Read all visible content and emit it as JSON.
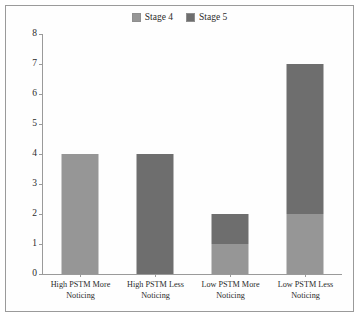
{
  "chart_data": {
    "type": "bar",
    "subtype": "stacked-column",
    "title": "",
    "xlabel": "",
    "ylabel": "",
    "ylim": [
      0,
      8
    ],
    "ytick_step": 1,
    "yticks": [
      "8",
      "7",
      "6",
      "5",
      "4",
      "3",
      "2",
      "1",
      "0"
    ],
    "grid": false,
    "legend_position": "top-center",
    "categories": [
      "High PSTM More Noticing",
      "High PSTM Less Noticing",
      "Low PSTM More Noticing",
      "Low PSTM Less Noticing"
    ],
    "series": [
      {
        "name": "Stage 4",
        "color": "#969696",
        "values": [
          4,
          0,
          1,
          2
        ]
      },
      {
        "name": "Stage 5",
        "color": "#6e6e6e",
        "values": [
          0,
          4,
          1,
          5
        ]
      }
    ],
    "totals": [
      4,
      4,
      2,
      7
    ]
  },
  "legend": {
    "entries": [
      {
        "label": "Stage 4",
        "color": "#969696"
      },
      {
        "label": "Stage 5",
        "color": "#6e6e6e"
      }
    ]
  },
  "axis": {
    "y_labels": [
      "8",
      "7",
      "6",
      "5",
      "4",
      "3",
      "2",
      "1",
      "0"
    ],
    "x_labels": [
      "High PSTM More Noticing",
      "High PSTM Less Noticing",
      "Low PSTM More Noticing",
      "Low PSTM Less Noticing"
    ]
  },
  "colors": {
    "stage4": "#969696",
    "stage5": "#6e6e6e",
    "axis": "#9a9a9a",
    "border": "#9a9a9a",
    "background": "#fefefe"
  }
}
